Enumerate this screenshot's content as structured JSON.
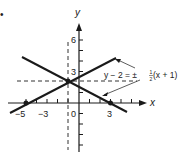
{
  "figure": {
    "bullet": "•",
    "axes": {
      "x_label": "x",
      "y_label": "y",
      "x_ticks": [
        "−5",
        "−3",
        "0",
        "3"
      ],
      "y_ticks": [
        "6",
        "3"
      ]
    },
    "equation": {
      "lhs": "y − 2 = ±",
      "frac_num": "1",
      "frac_den": "2",
      "rhs": "(x + 1)"
    },
    "lines": [
      {
        "name": "increasing",
        "slope": "1/2",
        "through": [
          -1,
          2
        ],
        "x_intercept": -5
      },
      {
        "name": "decreasing",
        "slope": "-1/2",
        "through": [
          -1,
          2
        ],
        "x_intercept": 3
      }
    ],
    "points": [
      {
        "label": "(-5,0)",
        "x": -5,
        "y": 0
      },
      {
        "label": "(3,0)",
        "x": 3,
        "y": 0
      },
      {
        "label": "(-1,2)",
        "x": -1,
        "y": 2
      }
    ],
    "colors": {
      "ink": "#1a1a1a",
      "dash": "#333333"
    }
  }
}
